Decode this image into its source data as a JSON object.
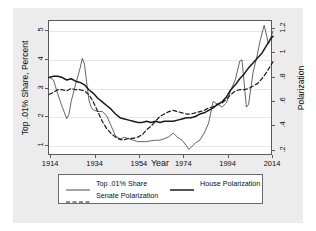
{
  "chart_data": {
    "type": "line",
    "title": "",
    "xlabel": "Year",
    "ylabel": "Top .01% Share, Percent",
    "ylabel_right": "Polarization",
    "xlim": [
      1913,
      2014
    ],
    "ylim": [
      0.65,
      5.35
    ],
    "ylim_right": [
      0.155,
      1.265
    ],
    "xticks": [
      "1914",
      "1934",
      "1954",
      "1974",
      "1994",
      "2014"
    ],
    "xtick_values": [
      1914,
      1934,
      1954,
      1974,
      1994,
      2014
    ],
    "yticks_left": [
      "1",
      "2",
      "3",
      "4",
      "5"
    ],
    "ytick_values_left": [
      1,
      2,
      3,
      4,
      5
    ],
    "yticks_right": [
      ".2",
      ".4",
      ".6",
      ".8",
      "1",
      "1.2"
    ],
    "ytick_values_right": [
      0.2,
      0.4,
      0.6,
      0.8,
      1.0,
      1.2
    ],
    "grid": true,
    "legend_position": "bottom",
    "series": [
      {
        "name": "Top .01% Share",
        "axis": "left",
        "style": "thin-solid",
        "color": "#3c3c3c",
        "x": [
          1913,
          1915,
          1917,
          1919,
          1921,
          1922,
          1923,
          1925,
          1927,
          1928,
          1929,
          1930,
          1931,
          1932,
          1933,
          1935,
          1937,
          1939,
          1941,
          1943,
          1945,
          1947,
          1949,
          1951,
          1953,
          1955,
          1957,
          1959,
          1961,
          1963,
          1965,
          1967,
          1969,
          1971,
          1973,
          1975,
          1976,
          1977,
          1979,
          1981,
          1983,
          1985,
          1987,
          1989,
          1991,
          1993,
          1995,
          1997,
          1999,
          2000,
          2001,
          2002,
          2003,
          2005,
          2007,
          2008,
          2010,
          2012,
          2014
        ],
        "values": [
          3.4,
          3.3,
          2.8,
          2.35,
          1.95,
          2.1,
          2.55,
          3.15,
          3.7,
          4.05,
          3.85,
          3.2,
          2.6,
          2.35,
          2.25,
          2.2,
          2.2,
          2.05,
          1.7,
          1.35,
          1.25,
          1.3,
          1.25,
          1.2,
          1.15,
          1.15,
          1.15,
          1.18,
          1.2,
          1.2,
          1.25,
          1.32,
          1.45,
          1.3,
          1.2,
          1.0,
          0.88,
          0.95,
          1.1,
          1.2,
          1.45,
          1.8,
          2.55,
          2.45,
          2.35,
          2.5,
          2.95,
          3.3,
          3.95,
          4.0,
          3.2,
          2.35,
          2.45,
          3.55,
          4.2,
          4.6,
          5.2,
          4.55,
          5.0
        ]
      },
      {
        "name": "House Polarization",
        "axis": "right",
        "style": "thick-solid",
        "color": "#1a1a1a",
        "x": [
          1913,
          1915,
          1917,
          1919,
          1921,
          1923,
          1925,
          1927,
          1929,
          1931,
          1933,
          1935,
          1937,
          1939,
          1941,
          1943,
          1945,
          1947,
          1949,
          1951,
          1953,
          1955,
          1957,
          1959,
          1961,
          1963,
          1965,
          1967,
          1969,
          1971,
          1973,
          1975,
          1977,
          1979,
          1981,
          1983,
          1985,
          1987,
          1989,
          1991,
          1993,
          1995,
          1997,
          1999,
          2001,
          2003,
          2005,
          2007,
          2009,
          2011,
          2013,
          2014
        ],
        "values": [
          0.8,
          0.81,
          0.81,
          0.8,
          0.78,
          0.79,
          0.77,
          0.76,
          0.74,
          0.7,
          0.67,
          0.63,
          0.6,
          0.57,
          0.54,
          0.5,
          0.47,
          0.46,
          0.45,
          0.44,
          0.43,
          0.43,
          0.44,
          0.43,
          0.44,
          0.43,
          0.44,
          0.44,
          0.44,
          0.45,
          0.46,
          0.47,
          0.47,
          0.48,
          0.5,
          0.51,
          0.53,
          0.55,
          0.58,
          0.6,
          0.64,
          0.7,
          0.74,
          0.79,
          0.83,
          0.88,
          0.92,
          0.96,
          1.0,
          1.06,
          1.12,
          1.14
        ]
      },
      {
        "name": "Senate Polarization",
        "axis": "right",
        "style": "dashed",
        "color": "#1a1a1a",
        "x": [
          1913,
          1915,
          1917,
          1919,
          1921,
          1923,
          1925,
          1927,
          1929,
          1931,
          1933,
          1935,
          1937,
          1939,
          1941,
          1943,
          1945,
          1947,
          1949,
          1951,
          1953,
          1955,
          1957,
          1959,
          1961,
          1963,
          1965,
          1967,
          1969,
          1971,
          1973,
          1975,
          1977,
          1979,
          1981,
          1983,
          1985,
          1987,
          1989,
          1991,
          1993,
          1995,
          1997,
          1999,
          2001,
          2003,
          2005,
          2007,
          2009,
          2011,
          2013,
          2014
        ],
        "values": [
          0.66,
          0.68,
          0.7,
          0.7,
          0.69,
          0.71,
          0.7,
          0.7,
          0.69,
          0.66,
          0.6,
          0.52,
          0.44,
          0.38,
          0.34,
          0.31,
          0.29,
          0.29,
          0.3,
          0.3,
          0.31,
          0.33,
          0.37,
          0.4,
          0.44,
          0.48,
          0.5,
          0.52,
          0.53,
          0.52,
          0.51,
          0.5,
          0.5,
          0.51,
          0.52,
          0.53,
          0.55,
          0.56,
          0.58,
          0.59,
          0.62,
          0.66,
          0.69,
          0.7,
          0.7,
          0.71,
          0.73,
          0.75,
          0.79,
          0.84,
          0.9,
          0.93
        ]
      }
    ]
  },
  "legend": {
    "entries": [
      {
        "label": "Top .01% Share",
        "style": "thin-solid"
      },
      {
        "label": "House Polarization",
        "style": "thick-solid"
      },
      {
        "label": "Senate Polarization",
        "style": "dashed"
      }
    ]
  }
}
